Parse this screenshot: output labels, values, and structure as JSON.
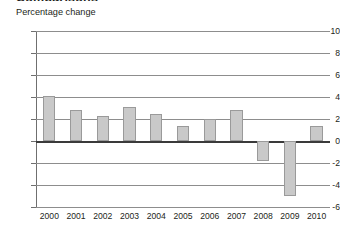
{
  "header": {
    "clipped_title": "Comparisons",
    "subtitle": "Percentage change"
  },
  "chart_data": {
    "type": "bar",
    "title": "Comparisons",
    "subtitle": "Percentage change",
    "xlabel": "",
    "ylabel": "Percentage change",
    "ylim": [
      -6,
      10
    ],
    "yticks": [
      10,
      8,
      6,
      4,
      2,
      0,
      -2,
      -4,
      -6
    ],
    "ytick_labels": [
      "10",
      "8",
      "6",
      "4",
      "2",
      "0",
      "-2",
      "-4",
      "-6"
    ],
    "grid": true,
    "legend": null,
    "bar_color": "#c9c9c9",
    "bar_edge_color": "#9a9a9a",
    "zero_line_color": "#3a3a3a",
    "gridline_color": "#8d8d8d",
    "categories": [
      "2000",
      "2001",
      "2002",
      "2003",
      "2004",
      "2005",
      "2006",
      "2007",
      "2008",
      "2009",
      "2010"
    ],
    "values": [
      4.1,
      2.8,
      2.3,
      3.1,
      2.5,
      1.4,
      2.0,
      2.8,
      -1.8,
      -5.0,
      1.4
    ]
  }
}
